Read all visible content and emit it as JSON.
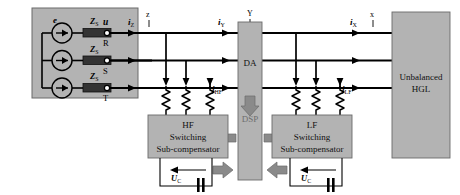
{
  "diagram": {
    "colors": {
      "block_fill": "#b3b3b3",
      "block_stroke": "#555555",
      "line": "#000000",
      "arrow_gray": "#808080",
      "dsp_text": "#6e6e6e",
      "impedance_fill": "#3a3a3a",
      "background": "#ffffff"
    },
    "source_block": {
      "name": "supply-source-block",
      "label_e": "e",
      "impedance_label": "Z",
      "impedance_sub": "S",
      "impedance_count": 3,
      "source_count": 3
    },
    "terminals": {
      "voltage_label": "u",
      "phases": [
        "R",
        "S",
        "T"
      ]
    },
    "currents": {
      "iz": {
        "base": "i",
        "sub": "Z"
      },
      "iy": {
        "base": "i",
        "sub": "Y"
      },
      "ix": {
        "base": "i",
        "sub": "X"
      },
      "jhf": {
        "base": "j",
        "sub": "HF"
      },
      "jlf": {
        "base": "j",
        "sub": "LF"
      }
    },
    "node_labels": {
      "z": "z",
      "y": "Y",
      "x": "x"
    },
    "da_block": {
      "name": "data-acquisition-block",
      "label": "DA"
    },
    "dsp_block": {
      "name": "dsp-block",
      "label": "DSP"
    },
    "hf_compensator": {
      "name": "hf-switching-sub-compensator",
      "line1": "HF",
      "line2": "Switching",
      "line3": "Sub-compensator"
    },
    "lf_compensator": {
      "name": "lf-switching-sub-compensator",
      "line1": "LF",
      "line2": "Switching",
      "line3": "Sub-compensator"
    },
    "dc_links": {
      "label_base": "U",
      "label_sub": "C",
      "count": 2
    },
    "load_block": {
      "name": "unbalanced-hgl-load",
      "line1": "Unbalanced",
      "line2": "HGL"
    }
  }
}
